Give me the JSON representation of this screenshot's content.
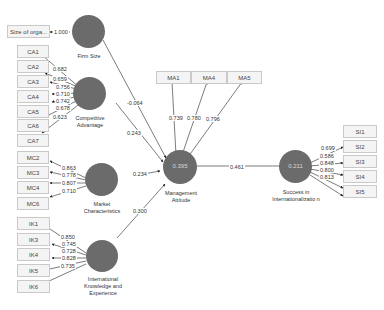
{
  "constructs": {
    "firm_size": {
      "label": "Firm Size",
      "r2": ""
    },
    "competitive_advantage": {
      "label": "Competitive Advantage",
      "r2": ""
    },
    "market_characteristics": {
      "label": "Market Characteristics",
      "r2": ""
    },
    "international_knowledge": {
      "label": "International Knowledge and Experience",
      "r2": ""
    },
    "management_attitude": {
      "label": "Management Attitude",
      "r2": "0.395"
    },
    "success": {
      "label": "Success in Internationalizatio n",
      "r2": "0.211"
    }
  },
  "indicators": {
    "firm_size": [
      {
        "name": "Size of orga...",
        "loading": "1.000"
      }
    ],
    "competitive_advantage": [
      {
        "name": "CA1",
        "loading": "0.682"
      },
      {
        "name": "CA2",
        "loading": "0.659"
      },
      {
        "name": "CA3",
        "loading": "0.756"
      },
      {
        "name": "CA4",
        "loading": "0.710"
      },
      {
        "name": "CA5",
        "loading": "0.742"
      },
      {
        "name": "CA6",
        "loading": "0.678"
      },
      {
        "name": "CA7",
        "loading": "0.623"
      }
    ],
    "market_characteristics": [
      {
        "name": "MC2",
        "loading": "0.863"
      },
      {
        "name": "MC3",
        "loading": "0.778"
      },
      {
        "name": "MC4",
        "loading": "0.807"
      },
      {
        "name": "MC6",
        "loading": "0.710"
      }
    ],
    "international_knowledge": [
      {
        "name": "IK1",
        "loading": "0.850"
      },
      {
        "name": "IK3",
        "loading": "0.745"
      },
      {
        "name": "IK4",
        "loading": "0.728"
      },
      {
        "name": "IK5",
        "loading": "0.828"
      },
      {
        "name": "IK6",
        "loading": "0.735"
      }
    ],
    "management_attitude": [
      {
        "name": "MA1",
        "loading": "0.739"
      },
      {
        "name": "MA4",
        "loading": "0.780"
      },
      {
        "name": "MA5",
        "loading": "0.796"
      }
    ],
    "success": [
      {
        "name": "SI1",
        "loading": "0.699"
      },
      {
        "name": "SI2",
        "loading": "0.586"
      },
      {
        "name": "SI3",
        "loading": "0.848"
      },
      {
        "name": "SI4",
        "loading": "0.800"
      },
      {
        "name": "SI5",
        "loading": "0.813"
      }
    ]
  },
  "paths": {
    "firm_size_to_ma": "-0.064",
    "ca_to_ma": "0.243",
    "mc_to_ma": "0.234",
    "ik_to_ma": "0.300",
    "ma_to_success": "0.461"
  },
  "colors": {
    "construct_fill": "#6b6b6b",
    "line": "#333333",
    "box_fill": "#f4f4f4",
    "box_border": "#c9c9c9"
  }
}
